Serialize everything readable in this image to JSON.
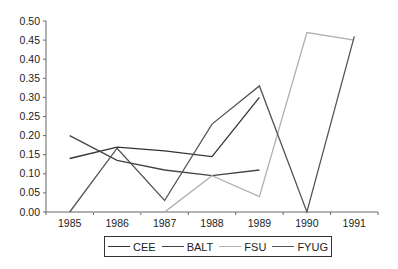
{
  "chart_data": {
    "type": "line",
    "title": "",
    "xlabel": "",
    "ylabel": "",
    "categories": [
      "1985",
      "1986",
      "1987",
      "1988",
      "1989",
      "1990",
      "1991"
    ],
    "yticks": [
      "0.00",
      "0.05",
      "0.10",
      "0.15",
      "0.20",
      "0.25",
      "0.30",
      "0.35",
      "0.40",
      "0.45",
      "0.50"
    ],
    "ylim": [
      0,
      0.5
    ],
    "grid": false,
    "legend_position": "bottom",
    "series": [
      {
        "name": "CEE",
        "color": "#333333",
        "values": [
          0.14,
          0.17,
          0.16,
          0.145,
          0.3,
          null,
          null
        ]
      },
      {
        "name": "BALT",
        "color": "#444444",
        "values": [
          0.2,
          0.135,
          0.11,
          0.095,
          0.11,
          null,
          null
        ]
      },
      {
        "name": "FSU",
        "color": "#b0b0b0",
        "values": [
          0.0,
          0.0,
          0.0,
          0.095,
          0.04,
          0.47,
          0.45
        ]
      },
      {
        "name": "FYUG",
        "color": "#555555",
        "values": [
          0.0,
          0.167,
          0.03,
          0.23,
          0.33,
          0.0,
          0.46
        ]
      }
    ]
  },
  "legend": {
    "items": [
      {
        "label": "CEE",
        "color": "#333333"
      },
      {
        "label": "BALT",
        "color": "#444444"
      },
      {
        "label": "FSU",
        "color": "#b0b0b0"
      },
      {
        "label": "FYUG",
        "color": "#555555"
      }
    ]
  }
}
